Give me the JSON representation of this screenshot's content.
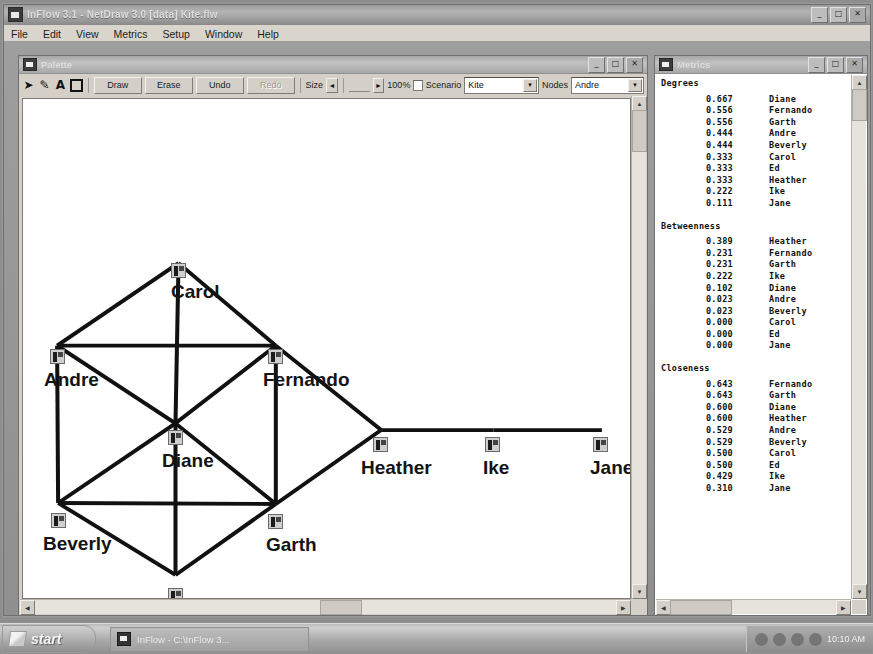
{
  "app": {
    "title": "InFlow 3.1 - NetDraw 3.0 [data] Kite.flw",
    "menu": [
      "File",
      "Edit",
      "View",
      "Metrics",
      "Setup",
      "Window",
      "Help"
    ],
    "window_buttons": {
      "minimize": "_",
      "maximize": "□",
      "close": "✕"
    }
  },
  "palette_window": {
    "title": "Palette",
    "window_buttons": {
      "minimize": "_",
      "maximize": "□",
      "close": "✕"
    },
    "toolbar": {
      "icons": [
        "pointer-icon",
        "pencil-icon",
        "text-icon",
        "rect-icon"
      ],
      "buttons": [
        "Draw",
        "Erase",
        "Undo",
        "Redo"
      ],
      "redo_disabled": true,
      "size_label": "Size",
      "zoom_value": "100%",
      "scenario_label": "Scenario",
      "scenario_value": "Kite",
      "nodes_label": "Nodes",
      "nodes_value": "Andre",
      "spin_left": "◄",
      "spin_right": "►",
      "combo_arrow": "▼"
    }
  },
  "metrics_window": {
    "title": "Metrics",
    "window_buttons": {
      "minimize": "_",
      "maximize": "□",
      "close": "✕"
    },
    "sections": [
      {
        "heading": "Degrees",
        "rows": [
          {
            "value": "0.667",
            "name": "Diane"
          },
          {
            "value": "0.556",
            "name": "Fernando"
          },
          {
            "value": "0.556",
            "name": "Garth"
          },
          {
            "value": "0.444",
            "name": "Andre"
          },
          {
            "value": "0.444",
            "name": "Beverly"
          },
          {
            "value": "0.333",
            "name": "Carol"
          },
          {
            "value": "0.333",
            "name": "Ed"
          },
          {
            "value": "0.333",
            "name": "Heather"
          },
          {
            "value": "0.222",
            "name": "Ike"
          },
          {
            "value": "0.111",
            "name": "Jane"
          }
        ]
      },
      {
        "heading": "Betweenness",
        "rows": [
          {
            "value": "0.389",
            "name": "Heather"
          },
          {
            "value": "0.231",
            "name": "Fernando"
          },
          {
            "value": "0.231",
            "name": "Garth"
          },
          {
            "value": "0.222",
            "name": "Ike"
          },
          {
            "value": "0.102",
            "name": "Diane"
          },
          {
            "value": "0.023",
            "name": "Andre"
          },
          {
            "value": "0.023",
            "name": "Beverly"
          },
          {
            "value": "0.000",
            "name": "Carol"
          },
          {
            "value": "0.000",
            "name": "Ed"
          },
          {
            "value": "0.000",
            "name": "Jane"
          }
        ]
      },
      {
        "heading": "Closeness",
        "rows": [
          {
            "value": "0.643",
            "name": "Fernando"
          },
          {
            "value": "0.643",
            "name": "Garth"
          },
          {
            "value": "0.600",
            "name": "Diane"
          },
          {
            "value": "0.600",
            "name": "Heather"
          },
          {
            "value": "0.529",
            "name": "Andre"
          },
          {
            "value": "0.529",
            "name": "Beverly"
          },
          {
            "value": "0.500",
            "name": "Carol"
          },
          {
            "value": "0.500",
            "name": "Ed"
          },
          {
            "value": "0.429",
            "name": "Ike"
          },
          {
            "value": "0.310",
            "name": "Jane"
          }
        ]
      }
    ]
  },
  "chart_data": {
    "type": "network",
    "node_color": "#cfcfcf",
    "edge_color": "#111111",
    "nodes": [
      {
        "id": "Carol",
        "label": "Carol",
        "x": 148,
        "y": 164,
        "label_dx": 0,
        "label_dy": 18
      },
      {
        "id": "Andre",
        "label": "Andre",
        "x": 27,
        "y": 250,
        "label_dx": -6,
        "label_dy": 20
      },
      {
        "id": "Fernando",
        "label": "Fernando",
        "x": 245,
        "y": 250,
        "label_dx": -5,
        "label_dy": 20
      },
      {
        "id": "Diane",
        "label": "Diane",
        "x": 145,
        "y": 331,
        "label_dx": -6,
        "label_dy": 20
      },
      {
        "id": "Beverly",
        "label": "Beverly",
        "x": 28,
        "y": 414,
        "label_dx": -8,
        "label_dy": 20
      },
      {
        "id": "Garth",
        "label": "Garth",
        "x": 245,
        "y": 415,
        "label_dx": -2,
        "label_dy": 20
      },
      {
        "id": "Ed",
        "label": "Ed",
        "x": 145,
        "y": 489,
        "label_dx": 0,
        "label_dy": 20
      },
      {
        "id": "Heather",
        "label": "Heather",
        "x": 350,
        "y": 338,
        "label_dx": -12,
        "label_dy": 20
      },
      {
        "id": "Ike",
        "label": "Ike",
        "x": 462,
        "y": 338,
        "label_dx": -2,
        "label_dy": 20
      },
      {
        "id": "Jane",
        "label": "Jane",
        "x": 570,
        "y": 338,
        "label_dx": -3,
        "label_dy": 20
      }
    ],
    "edges": [
      [
        "Carol",
        "Andre"
      ],
      [
        "Carol",
        "Fernando"
      ],
      [
        "Carol",
        "Diane"
      ],
      [
        "Andre",
        "Fernando"
      ],
      [
        "Andre",
        "Diane"
      ],
      [
        "Andre",
        "Beverly"
      ],
      [
        "Fernando",
        "Diane"
      ],
      [
        "Fernando",
        "Garth"
      ],
      [
        "Fernando",
        "Heather"
      ],
      [
        "Diane",
        "Beverly"
      ],
      [
        "Diane",
        "Garth"
      ],
      [
        "Diane",
        "Ed"
      ],
      [
        "Beverly",
        "Garth"
      ],
      [
        "Beverly",
        "Ed"
      ],
      [
        "Garth",
        "Ed"
      ],
      [
        "Garth",
        "Heather"
      ],
      [
        "Heather",
        "Ike"
      ],
      [
        "Ike",
        "Jane"
      ]
    ]
  },
  "taskbar": {
    "start_label": "start",
    "task_item": "InFlow - C:\\InFlow 3...",
    "clock": "10:10 AM"
  }
}
